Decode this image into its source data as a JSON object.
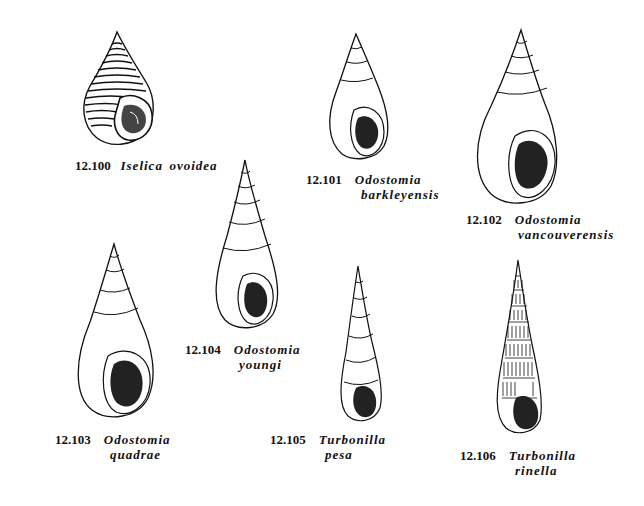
{
  "plate": {
    "figures": [
      {
        "id": "12.100",
        "genus": "Iselica",
        "species": "ovoidea",
        "caption_layout": "single-line"
      },
      {
        "id": "12.101",
        "genus": "Odostomia",
        "species": "barkleyensis",
        "caption_layout": "two-line"
      },
      {
        "id": "12.102",
        "genus": "Odostomia",
        "species": "vancouverensis",
        "caption_layout": "two-line"
      },
      {
        "id": "12.103",
        "genus": "Odostomia",
        "species": "quadrae",
        "caption_layout": "two-line"
      },
      {
        "id": "12.104",
        "genus": "Odostomia",
        "species": "youngi",
        "caption_layout": "two-line"
      },
      {
        "id": "12.105",
        "genus": "Turbonilla",
        "species": "pesa",
        "caption_layout": "two-line"
      },
      {
        "id": "12.106",
        "genus": "Turbonilla",
        "species": "rinella",
        "caption_layout": "two-line"
      }
    ]
  }
}
